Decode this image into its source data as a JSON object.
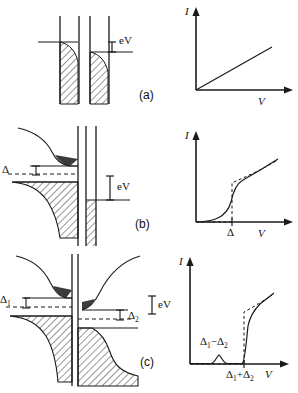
{
  "figure": {
    "panels": [
      {
        "tag": "(a)",
        "case": "normal-normal",
        "diagram": {
          "energy_label": "eV",
          "gap_labels": [],
          "fermi_level_label": ""
        },
        "plot": {
          "ylabel": "I",
          "xlabel": "V",
          "tick_labels": [],
          "curve_kind": "linear-ohmic"
        }
      },
      {
        "tag": "(b)",
        "case": "normal-superconductor",
        "diagram": {
          "energy_label": "eV",
          "gap_labels": [
            "Δ"
          ],
          "fermi_level_label": ""
        },
        "plot": {
          "ylabel": "I",
          "xlabel": "V",
          "tick_labels": [
            "Δ"
          ],
          "curve_kind": "gap-onset-step"
        }
      },
      {
        "tag": "(c)",
        "case": "superconductor-superconductor",
        "diagram": {
          "energy_label": "eV",
          "gap_labels": [
            "Δ1",
            "Δ2"
          ],
          "fermi_level_label": ""
        },
        "plot": {
          "ylabel": "I",
          "xlabel": "V",
          "tick_labels": [
            "Δ1−Δ2",
            "Δ1+Δ2"
          ],
          "curve_kind": "bump-plus-gap-onset"
        }
      }
    ]
  },
  "chart_data": [
    {
      "type": "line",
      "id": "iv-curve-a",
      "title": "",
      "xlabel": "V",
      "ylabel": "I",
      "xlim": [
        0,
        1
      ],
      "ylim": [
        0,
        1
      ],
      "grid": false,
      "legend": null,
      "series": [
        {
          "name": "ohmic",
          "style": "solid",
          "x": [
            0.0,
            0.2,
            0.4,
            0.6,
            0.8,
            1.0
          ],
          "y": [
            0.0,
            0.14,
            0.28,
            0.42,
            0.56,
            0.7
          ]
        }
      ],
      "tick_labels": {
        "x": [],
        "y": []
      }
    },
    {
      "type": "line",
      "id": "iv-curve-b",
      "title": "",
      "xlabel": "V",
      "ylabel": "I",
      "xlim": [
        0,
        1
      ],
      "ylim": [
        0,
        1
      ],
      "grid": false,
      "legend": null,
      "annotations": [
        {
          "text": "Δ",
          "x": 0.42,
          "y": 0
        }
      ],
      "series": [
        {
          "name": "T=0 (dashed)",
          "style": "dashed",
          "x": [
            0.0,
            0.4,
            0.42,
            0.42,
            0.5,
            0.65,
            0.8,
            1.0
          ],
          "y": [
            0.0,
            0.0,
            0.0,
            0.45,
            0.52,
            0.58,
            0.64,
            0.72
          ]
        },
        {
          "name": "finite T (solid)",
          "style": "solid",
          "x": [
            0.0,
            0.36,
            0.41,
            0.44,
            0.52,
            0.66,
            0.82,
            1.0
          ],
          "y": [
            0.0,
            0.02,
            0.26,
            0.5,
            0.56,
            0.62,
            0.68,
            0.75
          ]
        }
      ],
      "tick_labels": {
        "x": [
          "Δ"
        ],
        "y": []
      }
    },
    {
      "type": "line",
      "id": "iv-curve-c",
      "title": "",
      "xlabel": "V",
      "ylabel": "I",
      "xlim": [
        0,
        1
      ],
      "ylim": [
        0,
        1
      ],
      "grid": false,
      "legend": null,
      "annotations": [
        {
          "text": "Δ1−Δ2",
          "x": 0.3,
          "y": 0.12
        },
        {
          "text": "Δ1+Δ2",
          "x": 0.58,
          "y": 0
        }
      ],
      "series": [
        {
          "name": "T=0 (dashed)",
          "style": "dashed",
          "x": [
            0.0,
            0.56,
            0.58,
            0.58,
            0.66,
            0.8,
            1.0
          ],
          "y": [
            0.0,
            0.0,
            0.0,
            0.5,
            0.56,
            0.64,
            0.74
          ]
        },
        {
          "name": "finite T (solid)",
          "style": "solid",
          "x": [
            0.0,
            0.22,
            0.3,
            0.38,
            0.5,
            0.56,
            0.6,
            0.7,
            0.85,
            1.0
          ],
          "y": [
            0.01,
            0.01,
            0.1,
            0.01,
            0.01,
            0.3,
            0.52,
            0.6,
            0.68,
            0.76
          ]
        }
      ],
      "tick_labels": {
        "x": [
          "Δ1+Δ2"
        ],
        "y": []
      }
    }
  ]
}
